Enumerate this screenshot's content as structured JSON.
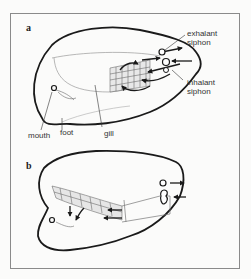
{
  "figure": {
    "panels": [
      {
        "id": "a",
        "label": "a",
        "annotations": {
          "exhalant_siphon": "exhalant siphon",
          "inhalant_siphon": "inhalant siphon",
          "mouth": "mouth",
          "foot": "foot",
          "gill": "gill"
        }
      },
      {
        "id": "b",
        "label": "b"
      }
    ]
  },
  "colors": {
    "outline": "#1a1a1a",
    "frame": "#8a8a8a",
    "background": "#fbfbfa"
  }
}
